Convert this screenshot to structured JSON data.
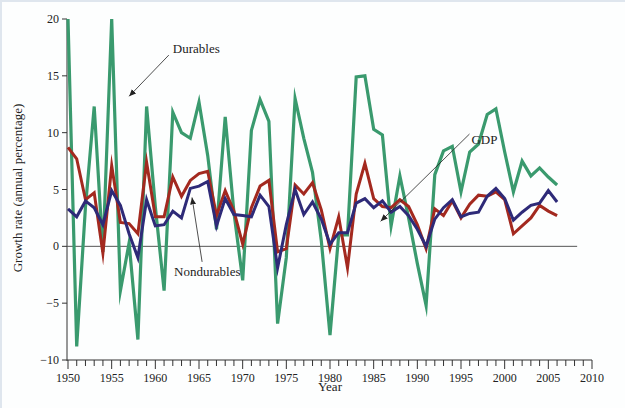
{
  "chart_data": {
    "type": "line",
    "title": "",
    "xlabel": "Year",
    "ylabel": "Growth rate (annual percentage)",
    "xlim": [
      1950,
      2010
    ],
    "ylim": [
      -10,
      20
    ],
    "x_ticks": [
      1950,
      1955,
      1960,
      1965,
      1970,
      1975,
      1980,
      1985,
      1990,
      1995,
      2000,
      2005,
      2010
    ],
    "y_ticks": [
      -10,
      -5,
      0,
      5,
      10,
      15,
      20
    ],
    "x_tick_labels": [
      "1950",
      "1955",
      "1960",
      "1965",
      "1970",
      "1975",
      "1980",
      "1985",
      "1990",
      "1995",
      "2000",
      "2005",
      "2010"
    ],
    "y_tick_labels": [
      "−10",
      "−5",
      "0",
      "5",
      "10",
      "15",
      "20"
    ],
    "grid": false,
    "zero_line": true,
    "legend": "inline annotations with arrows",
    "x": [
      1950,
      1951,
      1952,
      1953,
      1954,
      1955,
      1956,
      1957,
      1958,
      1959,
      1960,
      1961,
      1962,
      1963,
      1964,
      1965,
      1966,
      1967,
      1968,
      1969,
      1970,
      1971,
      1972,
      1973,
      1974,
      1975,
      1976,
      1977,
      1978,
      1979,
      1980,
      1981,
      1982,
      1983,
      1984,
      1985,
      1986,
      1987,
      1988,
      1989,
      1990,
      1991,
      1992,
      1993,
      1994,
      1995,
      1996,
      1997,
      1998,
      1999,
      2000,
      2001,
      2002,
      2003,
      2004,
      2005,
      2006
    ],
    "series": [
      {
        "name": "Durables",
        "color": "#3a9a6e",
        "values": [
          20.0,
          -8.8,
          3.5,
          12.3,
          -0.5,
          20.0,
          -3.9,
          0.3,
          -8.2,
          12.3,
          3.5,
          -3.9,
          11.8,
          10.0,
          9.5,
          12.7,
          8.0,
          1.5,
          11.4,
          3.0,
          -3.0,
          10.2,
          12.9,
          11.0,
          -6.8,
          -1.0,
          13.0,
          9.5,
          6.5,
          0.5,
          -7.8,
          1.0,
          1.0,
          14.9,
          15.0,
          10.3,
          9.8,
          1.8,
          6.2,
          2.5,
          -1.5,
          -5.2,
          6.3,
          8.4,
          8.8,
          4.8,
          8.3,
          9.0,
          11.6,
          12.1,
          8.3,
          4.8,
          7.5,
          6.2,
          6.9,
          6.1,
          5.4
        ]
      },
      {
        "name": "GDP",
        "color": "#a3291f",
        "values": [
          8.7,
          7.7,
          4.1,
          4.7,
          -0.6,
          7.1,
          2.1,
          2.0,
          1.1,
          7.4,
          2.6,
          2.6,
          6.1,
          4.4,
          5.8,
          6.4,
          6.6,
          2.7,
          4.9,
          3.1,
          0.2,
          3.4,
          5.3,
          5.8,
          -0.5,
          -0.2,
          5.4,
          4.6,
          5.6,
          3.2,
          -0.2,
          2.6,
          -1.9,
          4.6,
          7.3,
          4.2,
          3.5,
          3.4,
          4.1,
          3.5,
          1.9,
          -0.2,
          3.3,
          2.7,
          4.0,
          2.5,
          3.7,
          4.5,
          4.4,
          4.8,
          4.1,
          1.1,
          1.8,
          2.5,
          3.6,
          3.1,
          2.7
        ]
      },
      {
        "name": "Nondurables",
        "color": "#2e2a78",
        "values": [
          3.3,
          2.6,
          4.0,
          3.4,
          1.9,
          4.9,
          3.6,
          1.1,
          -1.0,
          4.1,
          1.8,
          1.9,
          3.1,
          2.5,
          5.1,
          5.3,
          5.7,
          1.8,
          4.2,
          2.8,
          2.7,
          2.6,
          4.5,
          3.5,
          -1.9,
          1.9,
          5.0,
          2.8,
          3.9,
          2.4,
          0.2,
          1.2,
          1.2,
          3.8,
          4.2,
          3.4,
          4.0,
          3.0,
          3.5,
          2.7,
          1.5,
          0.0,
          2.4,
          3.4,
          4.1,
          2.6,
          2.9,
          3.0,
          4.4,
          5.1,
          4.2,
          2.3,
          3.0,
          3.6,
          3.8,
          4.9,
          3.9
        ]
      }
    ],
    "annotations": [
      {
        "label": "Durables",
        "text_x": 1962.0,
        "text_y": 17.0,
        "arrow_to_x": 1957.0,
        "arrow_to_y": 13.2
      },
      {
        "label": "GDP",
        "text_x": 1996.2,
        "text_y": 9.0,
        "arrow_to_x": 1985.8,
        "arrow_to_y": 2.2
      },
      {
        "label": "Nondurables",
        "text_x": 1966.5,
        "text_y": -2.6,
        "arrow_to_x": 1964.2,
        "arrow_to_y": 4.3
      }
    ]
  }
}
